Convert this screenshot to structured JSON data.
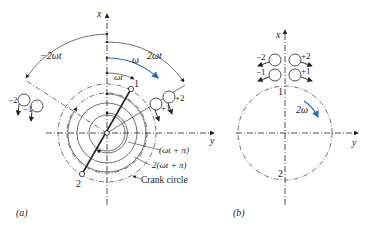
{
  "diagram_a": {
    "caption": "(a)",
    "axis_x_label": "x",
    "axis_y_label": "y",
    "omega_label": "ω",
    "two_omega_t_label": "2ωt",
    "neg_two_omega_t_label": "−2ωt",
    "omega_t_label": "ωt",
    "angle1_label": "(ωt + π)",
    "angle2_label": "2(ωt + π)",
    "crank_circle_label": "Crank circle",
    "point1_label": "1",
    "point2_label": "2",
    "mass_labels": {
      "m_neg2": "−2",
      "m_neg1": "−1",
      "m_pos1": "+1",
      "m_pos2": "+2"
    },
    "accent_color": "#2a6db5"
  },
  "diagram_b": {
    "caption": "(b)",
    "axis_x_label": "x",
    "axis_y_label": "y",
    "two_omega_label": "2ω",
    "point1_label": "1",
    "point2_label": "2",
    "mass_labels": {
      "m_neg2": "−2",
      "m_neg1": "−1",
      "m_pos1": "+1",
      "m_pos2": "+2"
    },
    "accent_color": "#2a6db5"
  }
}
